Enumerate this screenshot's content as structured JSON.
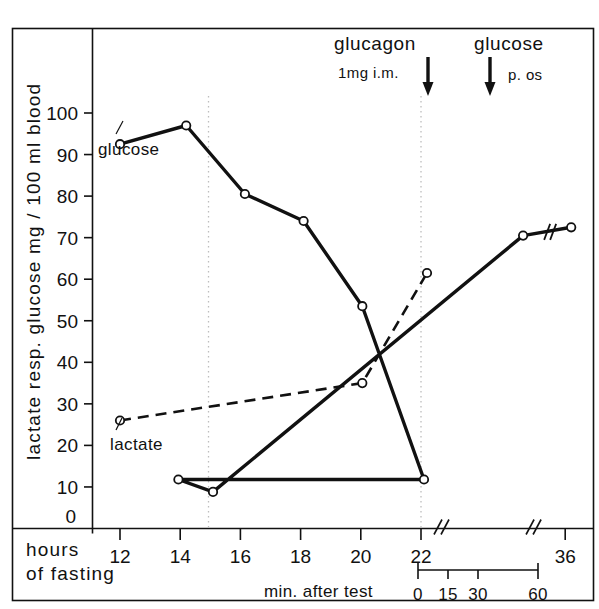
{
  "figure": {
    "ylabel": "lactate  resp.  glucose    mg / 100 ml blood",
    "xlabel_line1": "hours",
    "xlabel_line2": "of fasting",
    "sub_axis_label": "min. after test",
    "zero_label": "0"
  },
  "annotations": {
    "glucagon": {
      "title": "glucagon",
      "sub": "1mg  i.m.",
      "arrow_icon": "down-arrow"
    },
    "glucose_dose": {
      "title": "glucose",
      "sub": "p. os",
      "arrow_icon": "down-arrow"
    }
  },
  "series_labels": {
    "glucose": "glucose",
    "lactate": "lactate"
  },
  "chart_data": {
    "type": "line",
    "title": "",
    "xlabel": "hours of fasting",
    "ylabel": "lactate resp. glucose  mg / 100 ml blood",
    "ylim": [
      0,
      100
    ],
    "yticks": [
      0,
      10,
      20,
      30,
      40,
      50,
      60,
      70,
      80,
      90,
      100
    ],
    "ytick_labels": [
      "0",
      "10",
      "20",
      "30",
      "40",
      "50",
      "60",
      "70",
      "80",
      "90",
      "100"
    ],
    "xticks": [
      12,
      14,
      16,
      18,
      20,
      22,
      36
    ],
    "xtick_labels": [
      "12",
      "14",
      "16",
      "18",
      "20",
      "22",
      "36"
    ],
    "axis_breaks": [
      22.3,
      34.8
    ],
    "grid": false,
    "legend": "inline-labels",
    "secondary_axis": {
      "label": "min. after test",
      "ticks": [
        0,
        15,
        30,
        60
      ],
      "tick_labels": [
        "0",
        "15",
        "30",
        "60"
      ],
      "anchor_hours": 22
    },
    "event_markers": [
      {
        "label": "glucagon",
        "sublabel": "1mg  i.m.",
        "hours": 22.0
      },
      {
        "label": "glucose",
        "sublabel": "p. os",
        "hours": 24.15
      }
    ],
    "series": [
      {
        "name": "glucose",
        "style": "solid",
        "marker": "open-circle",
        "points": [
          {
            "hours": 12.0,
            "value": 92.5
          },
          {
            "hours": 14.2,
            "value": 97.0
          },
          {
            "hours": 16.15,
            "value": 80.5
          },
          {
            "hours": 18.1,
            "value": 74.0
          },
          {
            "hours": 20.05,
            "value": 53.5
          },
          {
            "hours": 22.1,
            "value": 11.8
          },
          {
            "hours": 23.15,
            "value": 11.8
          },
          {
            "hours": 24.3,
            "value": 8.8
          },
          {
            "hours": 34.6,
            "value": 70.5
          },
          {
            "hours": 36.2,
            "value": 72.5
          }
        ]
      },
      {
        "name": "lactate",
        "style": "dashed",
        "marker": "open-circle",
        "points": [
          {
            "hours": 12.0,
            "value": 26.0
          },
          {
            "hours": 20.05,
            "value": 35.0
          },
          {
            "hours": 22.2,
            "value": 61.5
          }
        ]
      }
    ]
  }
}
